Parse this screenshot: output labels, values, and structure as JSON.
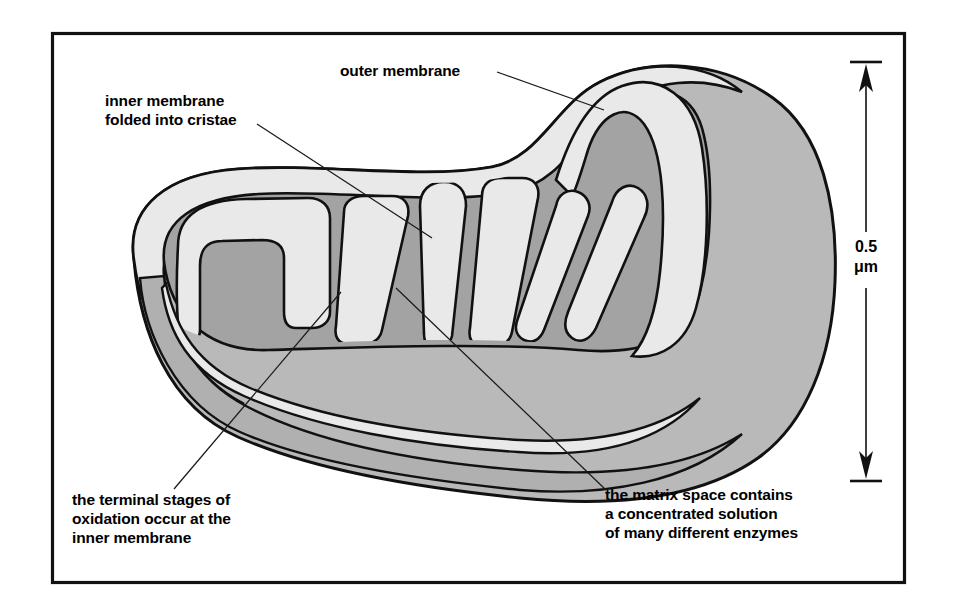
{
  "figure": {
    "frame_color": "#111111",
    "background_color": "#ffffff"
  },
  "palette": {
    "outer_body": "#b9b9b9",
    "membrane_light": "#e9e9e9",
    "matrix_dark": "#a3a3a3",
    "crista_fill": "#e9e9e9",
    "outline": "#111111",
    "text": "#000000"
  },
  "labels": {
    "outer_membrane": {
      "lines": [
        "outer membrane"
      ],
      "x": 340,
      "y": 76
    },
    "inner_membrane": {
      "lines": [
        "inner membrane",
        "folded into cristae"
      ],
      "x": 105,
      "y": 106
    },
    "terminal_stages": {
      "lines": [
        "the terminal stages of",
        "oxidation occur at the",
        "inner membrane"
      ],
      "x": 72,
      "y": 505
    },
    "matrix_space": {
      "lines": [
        "the matrix space contains",
        "a concentrated solution",
        "of many different enzymes"
      ],
      "x": 605,
      "y": 500
    }
  },
  "scale_bar": {
    "value": "0.5",
    "unit": "μm",
    "unit_display": "μm",
    "x": 866,
    "top_y": 62,
    "bottom_y": 481,
    "tick_half_width": 16
  }
}
